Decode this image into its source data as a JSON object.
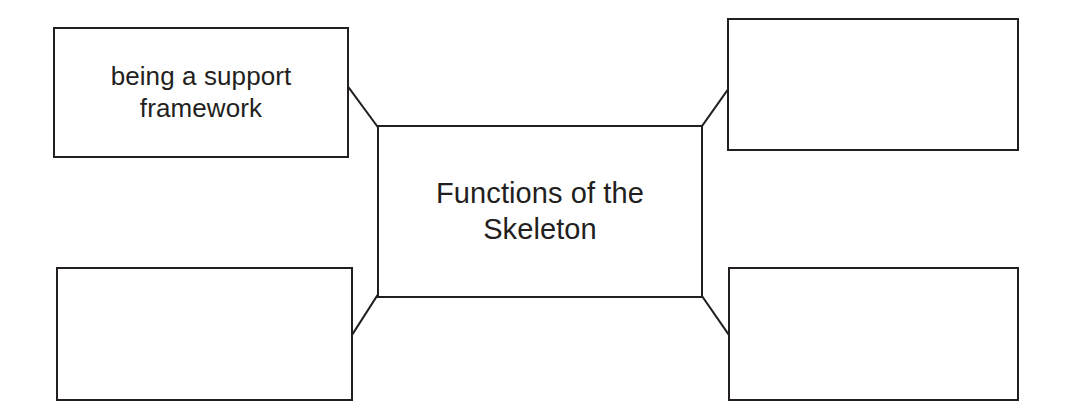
{
  "diagram": {
    "type": "concept-map",
    "title_node": "Functions of the Skeleton",
    "line_color": "#231f20",
    "background_color": "#ffffff",
    "text_color": "#231f20",
    "center": {
      "id": "center",
      "label": "Functions of the\nSkeleton"
    },
    "branches": [
      {
        "id": "top-left",
        "position": "top-left",
        "label": "being a support\nframework",
        "empty": false
      },
      {
        "id": "top-right",
        "position": "top-right",
        "label": "",
        "empty": true
      },
      {
        "id": "bottom-left",
        "position": "bottom-left",
        "label": "",
        "empty": true
      },
      {
        "id": "bottom-right",
        "position": "bottom-right",
        "label": "",
        "empty": true
      }
    ],
    "connectors": [
      {
        "id": "center-to-top-left",
        "from": [
          377,
          125
        ],
        "to": [
          348,
          88
        ]
      },
      {
        "id": "center-to-top-right",
        "from": [
          703,
          125
        ],
        "to": [
          729,
          88
        ]
      },
      {
        "id": "center-to-bottom-left",
        "from": [
          377,
          297
        ],
        "to": [
          352,
          335
        ]
      },
      {
        "id": "center-to-bottom-right",
        "from": [
          703,
          297
        ],
        "to": [
          729,
          335
        ]
      }
    ]
  }
}
